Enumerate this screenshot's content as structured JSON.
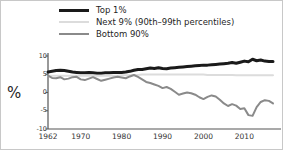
{
  "legend": {
    "position": "top",
    "items": [
      {
        "label": "Top 1%",
        "color": "#1a1a1a",
        "width": 3,
        "key": "top1"
      },
      {
        "label": "Next 9% (90th–99th percentiles)",
        "color": "#dcdcdc",
        "width": 2,
        "key": "next9"
      },
      {
        "label": "Bottom 90%",
        "color": "#8a8a8a",
        "width": 2,
        "key": "bottom90"
      }
    ]
  },
  "axes": {
    "ylabel": "%",
    "yticks": [
      10,
      5,
      0,
      -5,
      -10
    ],
    "ytick_labels": [
      "10",
      "5",
      "0",
      "-5",
      "-10"
    ],
    "xtick_labels": [
      "1962",
      "1970",
      "1980",
      "1990",
      "2000",
      "2010"
    ],
    "xticks": [
      1962,
      1970,
      1980,
      1990,
      2000,
      2010
    ]
  },
  "chart_data": {
    "type": "line",
    "title": "",
    "subtitle": "",
    "xlabel": "",
    "ylabel": "%",
    "xlim": [
      1962,
      2017
    ],
    "ylim": [
      -10,
      10
    ],
    "grid": false,
    "legend_position": "top",
    "x": [
      1962,
      1963,
      1964,
      1965,
      1966,
      1967,
      1968,
      1969,
      1970,
      1971,
      1972,
      1973,
      1974,
      1975,
      1976,
      1977,
      1978,
      1979,
      1980,
      1981,
      1982,
      1983,
      1984,
      1985,
      1986,
      1987,
      1988,
      1989,
      1990,
      1991,
      1992,
      1993,
      1994,
      1995,
      1996,
      1997,
      1998,
      1999,
      2000,
      2001,
      2002,
      2003,
      2004,
      2005,
      2006,
      2007,
      2008,
      2009,
      2010,
      2011,
      2012,
      2013,
      2014,
      2015,
      2016,
      2017
    ],
    "series": [
      {
        "name": "Top 1%",
        "key": "top1",
        "color": "#1a1a1a",
        "width": 3,
        "values": [
          5.6,
          5.8,
          6.0,
          6.1,
          6.0,
          5.8,
          5.6,
          5.5,
          5.4,
          5.4,
          5.5,
          5.4,
          5.3,
          5.3,
          5.4,
          5.4,
          5.5,
          5.5,
          5.5,
          5.6,
          5.8,
          6.1,
          6.3,
          6.3,
          6.5,
          6.7,
          6.6,
          6.8,
          6.6,
          6.5,
          6.7,
          6.8,
          6.9,
          7.0,
          7.1,
          7.2,
          7.3,
          7.4,
          7.5,
          7.5,
          7.6,
          7.7,
          7.8,
          7.9,
          8.0,
          8.2,
          8.0,
          8.3,
          8.6,
          8.4,
          9.1,
          8.7,
          8.9,
          8.6,
          8.5,
          8.5
        ]
      },
      {
        "name": "Next 9% (90th–99th percentiles)",
        "key": "next9",
        "color": "#dcdcdc",
        "width": 2,
        "values": [
          4.6,
          4.6,
          4.6,
          4.6,
          4.6,
          4.6,
          4.6,
          4.6,
          4.6,
          4.6,
          4.6,
          4.6,
          4.6,
          4.6,
          4.6,
          4.6,
          4.6,
          4.6,
          4.7,
          4.7,
          4.7,
          4.8,
          4.8,
          4.9,
          4.9,
          4.9,
          4.9,
          4.9,
          4.9,
          4.9,
          4.9,
          4.9,
          4.9,
          4.9,
          4.9,
          4.9,
          4.9,
          4.9,
          4.9,
          4.8,
          4.8,
          4.8,
          4.8,
          4.8,
          4.8,
          4.8,
          4.7,
          4.7,
          4.7,
          4.7,
          4.7,
          4.7,
          4.7,
          4.7,
          4.7,
          4.7
        ]
      },
      {
        "name": "Bottom 90%",
        "key": "bottom90",
        "color": "#8a8a8a",
        "width": 2,
        "values": [
          4.6,
          4.0,
          3.9,
          4.2,
          3.6,
          3.8,
          4.2,
          4.3,
          3.6,
          3.4,
          3.8,
          4.2,
          3.7,
          3.2,
          3.5,
          3.8,
          4.1,
          4.3,
          4.1,
          3.9,
          4.4,
          4.8,
          4.3,
          3.6,
          2.9,
          2.6,
          2.2,
          1.8,
          1.2,
          1.5,
          1.0,
          0.2,
          -0.6,
          -0.3,
          0.0,
          -0.2,
          -0.6,
          -1.3,
          -1.8,
          -1.2,
          -0.8,
          -1.1,
          -2.0,
          -3.0,
          -3.7,
          -3.2,
          -3.6,
          -4.5,
          -4.3,
          -6.2,
          -6.4,
          -4.0,
          -2.6,
          -2.1,
          -2.3,
          -3.0
        ]
      }
    ]
  }
}
